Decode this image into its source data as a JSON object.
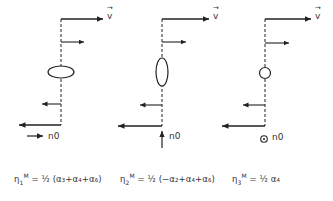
{
  "figure": {
    "panels": [
      {
        "id": 1,
        "symmetry_shape": "horizontal-ellipse",
        "v_label": "v",
        "n_label": "n0",
        "n_arrow_direction": "right",
        "equation": {
          "lhs": "η",
          "lhs_sub": "1",
          "lhs_sup": "M",
          "rhs": "= ½ (α₃+α₄+α₆)"
        }
      },
      {
        "id": 2,
        "symmetry_shape": "vertical-ellipse",
        "v_label": "v",
        "n_label": "n0",
        "n_arrow_direction": "up",
        "equation": {
          "lhs": "η",
          "lhs_sub": "2",
          "lhs_sup": "M",
          "rhs": "= ½ (−α₂+α₄+α₆)"
        }
      },
      {
        "id": 3,
        "symmetry_shape": "circle",
        "v_label": "v",
        "n_label": "n0",
        "n_arrow_direction": "out-of-plane",
        "equation": {
          "lhs": "η",
          "lhs_sub": "3",
          "lhs_sup": "M",
          "rhs": "= ½ α₄"
        }
      }
    ],
    "stroke_color": "#222222",
    "background_color": "#ffffff"
  }
}
